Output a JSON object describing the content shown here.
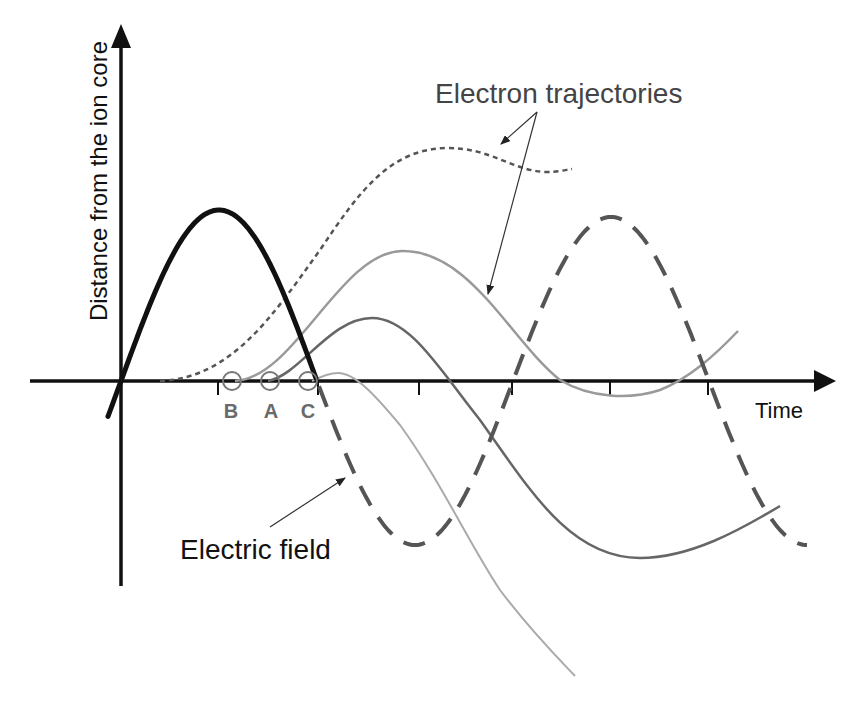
{
  "figure": {
    "y_axis_label": "Distance from the ion core",
    "x_axis_label": "Time",
    "annotations": {
      "electron_trajectories": "Electron trajectories",
      "electric_field": "Electric field"
    },
    "ionization_points": [
      {
        "label": "B"
      },
      {
        "label": "A"
      },
      {
        "label": "C"
      }
    ],
    "series": [
      {
        "name": "Electric field (solid half-cycle)",
        "style": "solid-thick"
      },
      {
        "name": "Electric field (continuation)",
        "style": "long-dash"
      },
      {
        "name": "Electron trajectory (dotted)",
        "style": "dotted"
      },
      {
        "name": "Electron trajectory from B",
        "style": "solid"
      },
      {
        "name": "Electron trajectory from A",
        "style": "solid"
      },
      {
        "name": "Electron trajectory from C",
        "style": "solid"
      }
    ]
  },
  "colors": {
    "axis": "#111111",
    "field_solid": "#111111",
    "field_dashed": "#555555",
    "traj_dotted": "#555555",
    "traj_b": "#9a9a9a",
    "traj_a": "#666666",
    "traj_c": "#aaaaaa",
    "circle": "#777777",
    "annotation_line": "#333333"
  }
}
